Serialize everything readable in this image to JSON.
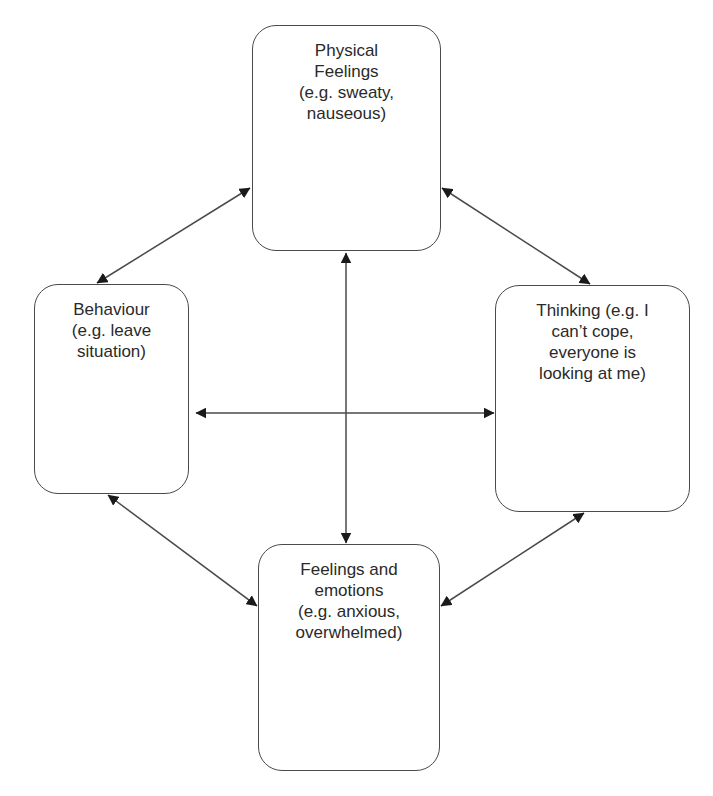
{
  "diagram": {
    "title": "",
    "type": "cycle",
    "colors": {
      "stroke": "#4a4a4a",
      "text": "#2a2a2a",
      "arrowhead": "#1a1a1a",
      "background": "#ffffff"
    },
    "nodes": [
      {
        "id": "physical",
        "label": "Physical\nFeelings\n(e.g. sweaty,\nnauseous)",
        "box": {
          "x": 252,
          "y": 25,
          "w": 189,
          "h": 226
        }
      },
      {
        "id": "behaviour",
        "label": "Behaviour\n(e.g. leave\nsituation)",
        "box": {
          "x": 34,
          "y": 284,
          "w": 155,
          "h": 210
        }
      },
      {
        "id": "thinking",
        "label": "Thinking (e.g. I\ncan’t cope,\neveryone is\nlooking at me)",
        "box": {
          "x": 495,
          "y": 285,
          "w": 195,
          "h": 227
        }
      },
      {
        "id": "feelings",
        "label": "Feelings and\nemotions\n(e.g. anxious,\noverwhelmed)",
        "box": {
          "x": 258,
          "y": 544,
          "w": 182,
          "h": 227
        }
      }
    ],
    "edges": [
      {
        "from": "physical",
        "to": "behaviour",
        "bidirectional": true,
        "x1": 250,
        "y1": 188,
        "x2": 97,
        "y2": 283
      },
      {
        "from": "physical",
        "to": "thinking",
        "bidirectional": true,
        "x1": 442,
        "y1": 188,
        "x2": 590,
        "y2": 284
      },
      {
        "from": "behaviour",
        "to": "feelings",
        "bidirectional": true,
        "x1": 108,
        "y1": 495,
        "x2": 257,
        "y2": 606
      },
      {
        "from": "thinking",
        "to": "feelings",
        "bidirectional": true,
        "x1": 584,
        "y1": 513,
        "x2": 441,
        "y2": 606
      },
      {
        "from": "behaviour",
        "to": "thinking",
        "bidirectional": true,
        "x1": 196,
        "y1": 413,
        "x2": 494,
        "y2": 413
      },
      {
        "from": "physical",
        "to": "feelings",
        "bidirectional": true,
        "x1": 346,
        "y1": 253,
        "x2": 346,
        "y2": 543
      }
    ]
  }
}
